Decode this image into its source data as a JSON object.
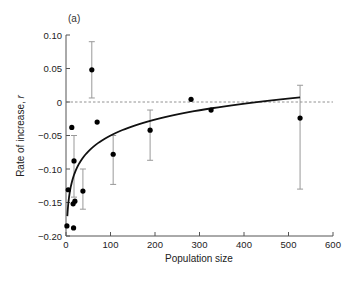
{
  "chart_data": {
    "type": "scatter",
    "panel_label": "(a)",
    "title": "",
    "xlabel": "Population size",
    "ylabel_prefix": "Rate of increase, ",
    "ylabel_var": "r",
    "xlim": [
      0,
      600
    ],
    "ylim": [
      -0.2,
      0.1
    ],
    "xticks": [
      0,
      100,
      200,
      300,
      400,
      500,
      600
    ],
    "xtick_labels": [
      "0",
      "100",
      "200",
      "300",
      "400",
      "500",
      "600"
    ],
    "yticks": [
      0.1,
      0.05,
      0,
      -0.05,
      -0.1,
      -0.15,
      -0.2
    ],
    "ytick_labels": [
      "0.10",
      "0.05",
      "0",
      "−0.05",
      "−0.10",
      "−0.15",
      "−0.20"
    ],
    "grid": false,
    "reference_line": {
      "y": 0,
      "style": "dashed"
    },
    "points": [
      {
        "x": 2,
        "y": -0.185
      },
      {
        "x": 5,
        "y": -0.131
      },
      {
        "x": 13,
        "y": -0.038
      },
      {
        "x": 16,
        "y": -0.152
      },
      {
        "x": 17,
        "y": -0.188
      },
      {
        "x": 18,
        "y": -0.088,
        "err_low": -0.142,
        "err_high": -0.05
      },
      {
        "x": 20,
        "y": -0.148
      },
      {
        "x": 38,
        "y": -0.133,
        "err_low": -0.16,
        "err_high": -0.1
      },
      {
        "x": 58,
        "y": 0.048,
        "err_low": 0.006,
        "err_high": 0.09
      },
      {
        "x": 70,
        "y": -0.03
      },
      {
        "x": 106,
        "y": -0.078,
        "err_low": -0.123,
        "err_high": -0.05
      },
      {
        "x": 189,
        "y": -0.042,
        "err_low": -0.087,
        "err_high": -0.012
      },
      {
        "x": 281,
        "y": 0.004
      },
      {
        "x": 326,
        "y": -0.012
      },
      {
        "x": 526,
        "y": -0.024,
        "err_low": -0.13,
        "err_high": 0.025
      }
    ],
    "fit_curve": {
      "type": "logarithmic",
      "equation": "r = a + b ln(N)",
      "a": -0.208,
      "b": 0.0343,
      "x_range": [
        3,
        526
      ]
    }
  }
}
